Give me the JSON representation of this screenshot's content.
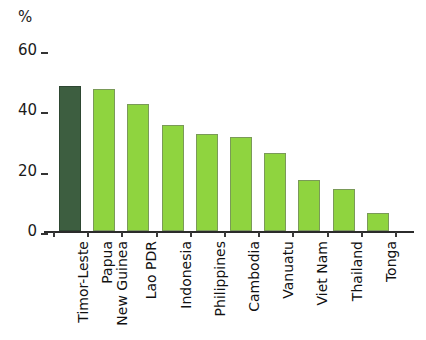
{
  "chart_data": {
    "type": "bar",
    "title": "",
    "subtitle": "",
    "xlabel": "",
    "ylabel": "%",
    "ylim": [
      0,
      60
    ],
    "yticks": [
      0,
      20,
      40,
      60
    ],
    "ytick_labels": [
      "0",
      "20",
      "40",
      "60"
    ],
    "grid": false,
    "legend": "none",
    "categories": [
      "Timor-Leste",
      "Papua New Guinea",
      "Lao PDR",
      "Indonesia",
      "Philippines",
      "Cambodia",
      "Vanuatu",
      "Viet Nam",
      "Thailand",
      "Tonga"
    ],
    "values": [
      48,
      47,
      42,
      35,
      32,
      31,
      26,
      17,
      14,
      6
    ],
    "bar_colors": [
      "#3d5e40",
      "#8fd43f",
      "#8fd43f",
      "#8fd43f",
      "#8fd43f",
      "#8fd43f",
      "#8fd43f",
      "#8fd43f",
      "#8fd43f",
      "#8fd43f"
    ],
    "highlight_index": 0,
    "colors": {
      "highlight": "#3d5e40",
      "bar": "#8fd43f",
      "axis": "#2b2b2b",
      "text": "#111111",
      "background": "#ffffff"
    }
  },
  "axis": {
    "unit_label": "%"
  }
}
